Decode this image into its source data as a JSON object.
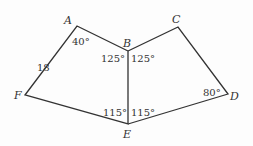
{
  "figure": {
    "vertices": {
      "A": {
        "label": "A",
        "x": 77,
        "y": 26
      },
      "B": {
        "label": "B",
        "x": 128,
        "y": 51
      },
      "C": {
        "label": "C",
        "x": 178,
        "y": 27
      },
      "D": {
        "label": "D",
        "x": 228,
        "y": 94
      },
      "E": {
        "label": "E",
        "x": 128,
        "y": 124
      },
      "F": {
        "label": "F",
        "x": 25,
        "y": 95
      }
    },
    "angles": {
      "A": "40°",
      "B_left": "125°",
      "B_right": "125°",
      "E_left": "115°",
      "E_right": "115°",
      "D": "80°"
    },
    "side_AF": "18",
    "stroke_color": "#333333"
  }
}
